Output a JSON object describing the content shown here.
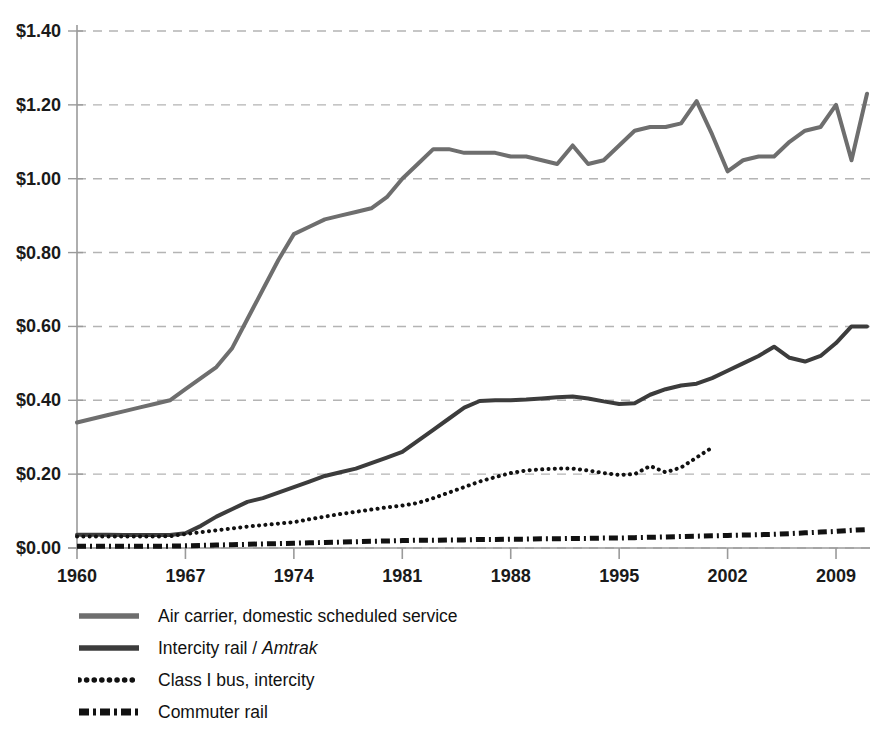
{
  "chart_data": {
    "type": "line",
    "title": "",
    "subtitle": "",
    "xlabel": "",
    "ylabel": "",
    "xlim": [
      1960,
      2011
    ],
    "ylim": [
      0.0,
      1.4
    ],
    "grid": true,
    "legend_position": "below-left",
    "y_tick_labels": [
      "$1.40",
      "$1.20",
      "$1.00",
      "$0.80",
      "$0.60",
      "$0.40",
      "$0.20",
      "$0.00"
    ],
    "y_tick_values": [
      1.4,
      1.2,
      1.0,
      0.8,
      0.6,
      0.4,
      0.2,
      0.0
    ],
    "x_tick_labels": [
      "1960",
      "1967",
      "1974",
      "1981",
      "1988",
      "1995",
      "2002",
      "2009"
    ],
    "x_tick_values": [
      1960,
      1967,
      1974,
      1981,
      1988,
      1995,
      2002,
      2009
    ],
    "series": [
      {
        "name": "Air carrier, domestic scheduled service",
        "color": "#6e6e6e",
        "style": "solid",
        "width": 4.0,
        "x": [
          1960,
          1961,
          1962,
          1963,
          1964,
          1965,
          1966,
          1967,
          1968,
          1969,
          1970,
          1971,
          1972,
          1973,
          1974,
          1975,
          1976,
          1977,
          1978,
          1979,
          1980,
          1981,
          1982,
          1983,
          1984,
          1985,
          1986,
          1987,
          1988,
          1989,
          1990,
          1991,
          1992,
          1993,
          1994,
          1995,
          1996,
          1997,
          1998,
          1999,
          2000,
          2001,
          2002,
          2003,
          2004,
          2005,
          2006,
          2007,
          2008,
          2009,
          2010,
          2011
        ],
        "values": [
          0.34,
          0.35,
          0.36,
          0.37,
          0.38,
          0.39,
          0.4,
          0.43,
          0.46,
          0.49,
          0.54,
          0.62,
          0.7,
          0.78,
          0.85,
          0.87,
          0.89,
          0.9,
          0.91,
          0.92,
          0.95,
          1.0,
          1.04,
          1.08,
          1.08,
          1.07,
          1.07,
          1.07,
          1.06,
          1.06,
          1.05,
          1.04,
          1.09,
          1.04,
          1.05,
          1.09,
          1.13,
          1.14,
          1.14,
          1.15,
          1.21,
          1.12,
          1.02,
          1.05,
          1.06,
          1.06,
          1.1,
          1.13,
          1.14,
          1.2,
          1.05,
          1.23
        ]
      },
      {
        "name": "Intercity rail / Amtrak",
        "color": "#3c3c3c",
        "style": "solid",
        "width": 4.0,
        "x": [
          1960,
          1961,
          1962,
          1963,
          1964,
          1965,
          1966,
          1967,
          1968,
          1969,
          1970,
          1971,
          1972,
          1973,
          1974,
          1975,
          1976,
          1977,
          1978,
          1979,
          1980,
          1981,
          1982,
          1983,
          1984,
          1985,
          1986,
          1987,
          1988,
          1989,
          1990,
          1991,
          1992,
          1993,
          1994,
          1995,
          1996,
          1997,
          1998,
          1999,
          2000,
          2001,
          2002,
          2003,
          2004,
          2005,
          2006,
          2007,
          2008,
          2009,
          2010,
          2011
        ],
        "values": [
          0.036,
          0.036,
          0.036,
          0.035,
          0.035,
          0.035,
          0.035,
          0.04,
          0.06,
          0.085,
          0.105,
          0.125,
          0.135,
          0.15,
          0.165,
          0.18,
          0.195,
          0.205,
          0.215,
          0.23,
          0.245,
          0.26,
          0.29,
          0.32,
          0.35,
          0.38,
          0.398,
          0.4,
          0.4,
          0.402,
          0.405,
          0.408,
          0.41,
          0.405,
          0.397,
          0.39,
          0.392,
          0.415,
          0.43,
          0.44,
          0.445,
          0.46,
          0.48,
          0.5,
          0.52,
          0.545,
          0.515,
          0.505,
          0.52,
          0.555,
          0.6,
          0.6
        ]
      },
      {
        "name": "Class I bus, intercity",
        "color": "#111111",
        "style": "dotted",
        "width": 4.0,
        "x": [
          1960,
          1961,
          1962,
          1963,
          1964,
          1965,
          1966,
          1967,
          1968,
          1969,
          1970,
          1971,
          1972,
          1973,
          1974,
          1975,
          1976,
          1977,
          1978,
          1979,
          1980,
          1981,
          1982,
          1983,
          1984,
          1985,
          1986,
          1987,
          1988,
          1989,
          1990,
          1991,
          1992,
          1993,
          1994,
          1995,
          1996,
          1997,
          1998,
          1999,
          2000,
          2001
        ],
        "values": [
          0.031,
          0.031,
          0.031,
          0.031,
          0.031,
          0.031,
          0.032,
          0.038,
          0.043,
          0.048,
          0.053,
          0.058,
          0.062,
          0.066,
          0.07,
          0.078,
          0.085,
          0.092,
          0.098,
          0.104,
          0.11,
          0.115,
          0.122,
          0.135,
          0.15,
          0.165,
          0.18,
          0.192,
          0.203,
          0.21,
          0.213,
          0.215,
          0.215,
          0.21,
          0.203,
          0.198,
          0.2,
          0.222,
          0.205,
          0.218,
          0.245,
          0.272
        ]
      },
      {
        "name": "Commuter rail",
        "color": "#111111",
        "style": "dashdot",
        "width": 5.0,
        "x": [
          1960,
          1961,
          1962,
          1963,
          1964,
          1965,
          1966,
          1967,
          1968,
          1969,
          1970,
          1971,
          1972,
          1973,
          1974,
          1975,
          1976,
          1977,
          1978,
          1979,
          1980,
          1981,
          1982,
          1983,
          1984,
          1985,
          1986,
          1987,
          1988,
          1989,
          1990,
          1991,
          1992,
          1993,
          1994,
          1995,
          1996,
          1997,
          1998,
          1999,
          2000,
          2001,
          2002,
          2003,
          2004,
          2005,
          2006,
          2007,
          2008,
          2009,
          2010,
          2011
        ],
        "values": [
          0.005,
          0.005,
          0.005,
          0.005,
          0.005,
          0.005,
          0.005,
          0.006,
          0.007,
          0.008,
          0.009,
          0.01,
          0.011,
          0.012,
          0.013,
          0.014,
          0.015,
          0.016,
          0.017,
          0.018,
          0.019,
          0.02,
          0.021,
          0.021,
          0.022,
          0.022,
          0.023,
          0.023,
          0.024,
          0.024,
          0.025,
          0.025,
          0.026,
          0.026,
          0.027,
          0.027,
          0.028,
          0.029,
          0.03,
          0.031,
          0.032,
          0.033,
          0.034,
          0.035,
          0.036,
          0.037,
          0.039,
          0.041,
          0.043,
          0.045,
          0.048,
          0.05
        ]
      }
    ]
  },
  "legend": {
    "items": [
      {
        "label": "Air carrier, domestic scheduled service",
        "label_pre": "Air carrier, domestic scheduled service",
        "label_italic": "",
        "label_post": "",
        "swatch": "air-carrier-swatch"
      },
      {
        "label": "Intercity rail / Amtrak",
        "label_pre": "Intercity rail / ",
        "label_italic": "Amtrak",
        "label_post": "",
        "swatch": "intercity-rail-swatch"
      },
      {
        "label": "Class I bus, intercity",
        "label_pre": "Class I bus, intercity",
        "label_italic": "",
        "label_post": "",
        "swatch": "class-i-bus-swatch"
      },
      {
        "label": "Commuter rail",
        "label_pre": "Commuter rail",
        "label_italic": "",
        "label_post": "",
        "swatch": "commuter-rail-swatch"
      }
    ]
  },
  "colors": {
    "air_carrier": "#6e6e6e",
    "intercity_rail": "#3c3c3c",
    "class_i_bus": "#111111",
    "commuter_rail": "#111111",
    "gridline": "#b4b4b4",
    "axis": "#9a9a9a",
    "text": "#1a1a1a",
    "background": "#ffffff"
  }
}
